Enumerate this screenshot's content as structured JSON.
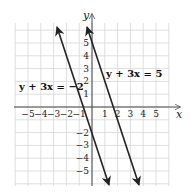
{
  "chart_data": {
    "type": "line",
    "title": "",
    "xlabel": "x",
    "ylabel": "y",
    "xlim": [
      -6,
      6
    ],
    "ylim": [
      -6,
      6.5
    ],
    "grid": true,
    "x_ticks": [
      "-5",
      "-4",
      "-3",
      "-2",
      "-1",
      "1",
      "2",
      "3",
      "4",
      "5"
    ],
    "y_ticks": [
      "5",
      "4",
      "3",
      "2",
      "1",
      "-2",
      "-3",
      "-4",
      "-5"
    ],
    "series": [
      {
        "name": "y + 3x = -2",
        "equation": "y = -3x - 2",
        "x": [
          -2.75,
          1.35
        ],
        "y": [
          6.25,
          -6.05
        ]
      },
      {
        "name": "y + 3x = 5",
        "equation": "y = -3x + 5",
        "x": [
          -0.4,
          3.65
        ],
        "y": [
          6.2,
          -5.95
        ]
      }
    ],
    "annotations": [
      {
        "text": "y + 3x = -2",
        "x": -4.8,
        "y": 1.8
      },
      {
        "text": "y + 3x = 5",
        "x": 1.1,
        "y": 2.8
      }
    ]
  },
  "labels": {
    "x_axis": "x",
    "y_axis": "y",
    "line1": "y + 3x = −2",
    "line2": "y + 3x = 5",
    "xt": [
      "−5",
      "−4",
      "−3",
      "−2",
      "−1",
      "1",
      "2",
      "3",
      "4",
      "5"
    ],
    "yt": [
      "5",
      "4",
      "3",
      "2",
      "1",
      "−2",
      "−3",
      "−4",
      "−5"
    ]
  }
}
